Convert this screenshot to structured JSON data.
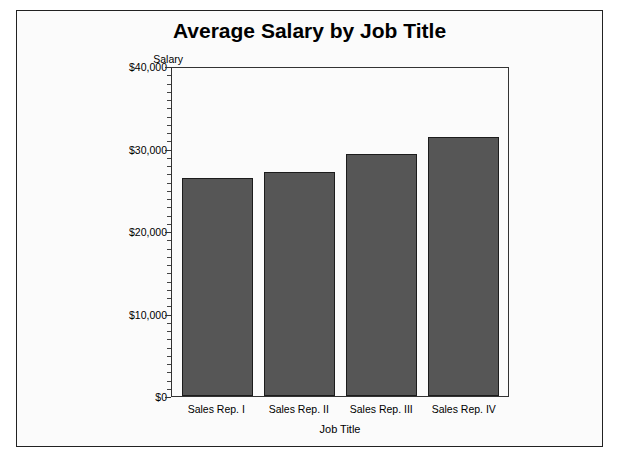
{
  "chart_data": {
    "type": "bar",
    "title": "Average Salary by Job Title",
    "xlabel": "Job Title",
    "ylabel": "Salary",
    "categories": [
      "Sales Rep. I",
      "Sales Rep. II",
      "Sales Rep. III",
      "Sales Rep. IV"
    ],
    "values": [
      26400,
      27200,
      29300,
      31400
    ],
    "ylim": [
      0,
      40000
    ],
    "ytick_labels": [
      "$40,000",
      "$30,000",
      "$20,000",
      "$10,000",
      "$0"
    ],
    "ytick_values": [
      40000,
      30000,
      20000,
      10000,
      0
    ],
    "minor_ticks_per_interval": 9,
    "grid": false,
    "legend": false,
    "bar_color": "#565656",
    "bar_border_color": "#1c1c1c",
    "plot_background": "#fbfbfb",
    "frame_color": "#222222"
  }
}
